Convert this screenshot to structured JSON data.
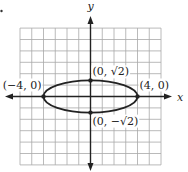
{
  "chart_data": {
    "type": "line",
    "title": "",
    "equation_hint": "x^2/16 + y^2/2 = 1",
    "xlabel": "x",
    "ylabel": "y",
    "xlim": [
      -6,
      6
    ],
    "ylim": [
      -6,
      6
    ],
    "grid": true,
    "curve": {
      "shape": "ellipse",
      "center": [
        0,
        0
      ],
      "semi_major_x": 4,
      "semi_minor_y": 1.4142
    },
    "points": [
      {
        "x": 0,
        "y": 1.4142,
        "label": "(0, √2)"
      },
      {
        "x": 0,
        "y": -1.4142,
        "label": "(0, −√2)"
      },
      {
        "x": -4,
        "y": 0,
        "label": "(−4, 0)"
      },
      {
        "x": 4,
        "y": 0,
        "label": "(4, 0)"
      }
    ]
  },
  "layout": {
    "origin_px": [
      90.5,
      96.5
    ],
    "unit_px_x": 11.75,
    "unit_px_y": 11.4,
    "grid_color": "#a8a8a8",
    "ink_color": "#222222"
  }
}
